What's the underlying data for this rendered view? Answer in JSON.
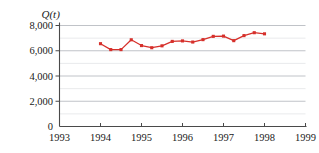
{
  "chart_data": {
    "type": "line",
    "title": "",
    "subtitle": "",
    "xlabel": "",
    "ylabel": "Q(t)",
    "ylabel_parts": {
      "symbol": "Q",
      "open": "(",
      "variable": "t",
      "close": ")"
    },
    "xlim": [
      1993,
      1999
    ],
    "ylim": [
      0,
      8000
    ],
    "grid": true,
    "grid_major_step": 2000,
    "grid_minor_step": 1000,
    "legend": null,
    "legend_position": "none",
    "series_color": "#d6302b",
    "marker": "square",
    "xticks": [
      1993,
      1994,
      1995,
      1996,
      1997,
      1998,
      1999
    ],
    "xtick_labels": [
      "1993",
      "1994",
      "1995",
      "1996",
      "1997",
      "1998",
      "1999"
    ],
    "yticks": [
      0,
      2000,
      4000,
      6000,
      8000
    ],
    "ytick_labels": [
      "0",
      "2,000",
      "4,000",
      "6,000",
      "8,000"
    ],
    "series": [
      {
        "name": "Q(t)",
        "color": "#d6302b",
        "x": [
          1994.0,
          1994.25,
          1994.5,
          1994.75,
          1995.0,
          1995.25,
          1995.5,
          1995.75,
          1996.0,
          1996.25,
          1996.5,
          1996.75,
          1997.0,
          1997.25,
          1997.5,
          1997.75,
          1998.0
        ],
        "values": [
          6560,
          6090,
          6090,
          6870,
          6410,
          6240,
          6390,
          6740,
          6780,
          6690,
          6880,
          7140,
          7160,
          6800,
          7200,
          7430,
          7340
        ]
      }
    ],
    "annotations": []
  }
}
